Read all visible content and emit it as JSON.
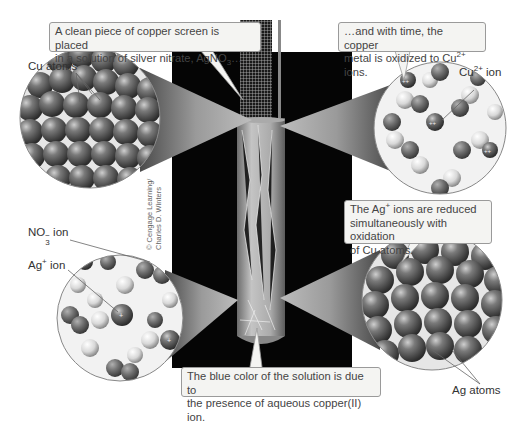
{
  "figure": {
    "callouts": {
      "top_left": {
        "line1": "A clean piece of copper screen is placed",
        "line2_prefix": "in a solution of silver nitrate, AgNO",
        "line2_sub": "3",
        "line2_suffix": "…"
      },
      "top_right": {
        "line1": "…and with time, the copper",
        "line2_prefix": "metal is oxidized to Cu",
        "line2_sup": "2+",
        "line2_suffix": " ions."
      },
      "middle_right": {
        "line1_prefix": "The Ag",
        "line1_sup": "+",
        "line1_suffix": " ions are reduced",
        "line2": "simultaneously with oxidation",
        "line3": "of Cu atoms."
      },
      "bottom": {
        "line1": "The blue color of the solution is due to",
        "line2": "the presence of aqueous copper(II) ion."
      }
    },
    "labels": {
      "cu_atoms": "Cu atoms",
      "cu_ion": {
        "prefix": "Cu",
        "sup": "2+",
        "suffix": " ion"
      },
      "no3_ion": {
        "prefix": "NO",
        "sub": "3",
        "sup": "−",
        "suffix": " ion"
      },
      "ag_ion": {
        "prefix": "Ag",
        "sup": "+",
        "suffix": " ion"
      },
      "ag_atoms": "Ag atoms"
    },
    "credit": {
      "line1": "© Cengage Learning/",
      "line2": "Charles D. Winters"
    },
    "colors": {
      "background": "#ffffff",
      "photo": "#050505",
      "callout_bg": "#f4f4f2",
      "callout_border": "#9a9a9a",
      "atom": "#6a6a6a"
    }
  }
}
